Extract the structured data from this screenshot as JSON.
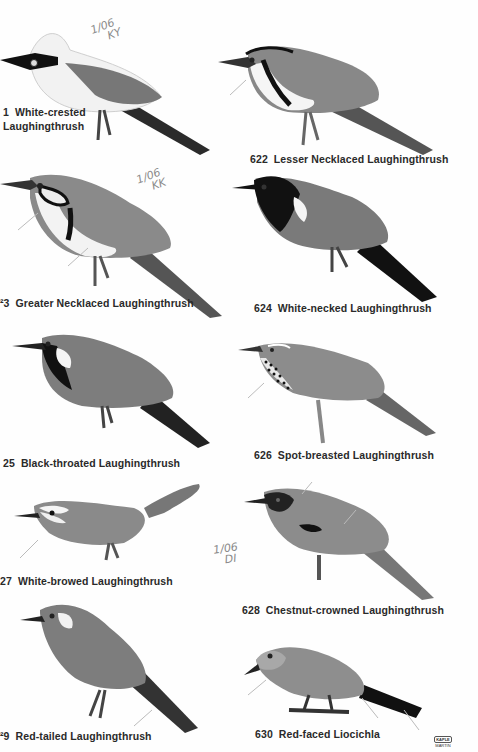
{
  "plate": {
    "left_column": [
      {
        "number": "1",
        "name_line1": "White-crested",
        "name_line2": "Laughingthrush",
        "note": "1/06 KY"
      },
      {
        "number": "⁢3",
        "name": "Greater Necklaced Laughingthrush",
        "note": "1/06 KK"
      },
      {
        "number": "25",
        "name": "Black-throated Laughingthrush"
      },
      {
        "number": "27",
        "name": "White-browed Laughingthrush"
      },
      {
        "number": "?9",
        "name": "Red-tailed Laughingthrush"
      }
    ],
    "right_column": [
      {
        "number": "622",
        "name": "Lesser Necklaced Laughingthrush"
      },
      {
        "number": "624",
        "name": "White-necked Laughingthrush"
      },
      {
        "number": "626",
        "name": "Spot-breasted Laughingthrush"
      },
      {
        "number": "628",
        "name": "Chestnut-crowned Laughingthrush",
        "note": "1/06 DI"
      },
      {
        "number": "630",
        "name": "Red-faced Liocichla"
      }
    ],
    "logo": {
      "line1": "KAPLE",
      "line2": "MARTIN"
    }
  },
  "labels": {
    "c1_num": "1",
    "c1_l1": "White-crested",
    "c1_l2": "Laughingthrush",
    "c2_num": "622",
    "c2_name": "Lesser Necklaced Laughingthrush",
    "c3_num": "²3",
    "c3_name": "Greater Necklaced Laughingthrush",
    "c4_num": "624",
    "c4_name": "White-necked Laughingthrush",
    "c5_num": "25",
    "c5_name": "Black-throated Laughingthrush",
    "c6_num": "626",
    "c6_name": "Spot-breasted Laughingthrush",
    "c7_num": "27",
    "c7_name": "White-browed Laughingthrush",
    "c8_num": "628",
    "c8_name": "Chestnut-crowned Laughingthrush",
    "c9_num": "²9",
    "c9_name": "Red-tailed Laughingthrush",
    "c10_num": "630",
    "c10_name": "Red-faced Liocichla"
  },
  "notes": {
    "n1_l1": "1/06",
    "n1_l2": "KY",
    "n2_l1": "1/06",
    "n2_l2": "KK",
    "n3_l1": "1/06",
    "n3_l2": "DI"
  }
}
